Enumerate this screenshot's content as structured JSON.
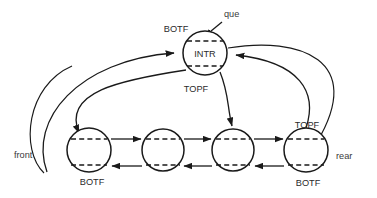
{
  "diagram": {
    "colors": {
      "stroke": "#1a1a1a",
      "text": "#2b2b2b",
      "background": "#ffffff"
    },
    "nodes": {
      "interior": {
        "id": "INTR",
        "inner_label": "INTR",
        "top_label": "BOTF",
        "bottom_label": "TOPF",
        "cx": 205,
        "cy": 53,
        "r": 22
      },
      "queue_items": [
        {
          "id": "node-1",
          "inner_label": "",
          "top_label": "",
          "bottom_label": "BOTF",
          "cx": 89,
          "cy": 150,
          "r": 22
        },
        {
          "id": "node-2",
          "inner_label": "",
          "top_label": "",
          "bottom_label": "",
          "cx": 163,
          "cy": 150,
          "r": 21
        },
        {
          "id": "node-3",
          "inner_label": "",
          "top_label": "",
          "bottom_label": "",
          "cx": 233,
          "cy": 150,
          "r": 21
        },
        {
          "id": "node-4",
          "inner_label": "",
          "top_label": "TOPF",
          "bottom_label": "BOTF",
          "cx": 306,
          "cy": 150,
          "r": 22
        }
      ]
    },
    "pointers": [
      {
        "name": "que",
        "label": "que",
        "x": 224,
        "y": 17
      },
      {
        "name": "front",
        "label": "front",
        "x": 16,
        "y": 155
      },
      {
        "name": "rear",
        "label": "rear",
        "x": 338,
        "y": 156
      }
    ],
    "field_labels": {
      "botf": "BOTF",
      "topf": "TOPF",
      "intr": "INTR"
    },
    "edges": [
      {
        "name": "que-to-intr",
        "kind": "arrow-straight"
      },
      {
        "name": "node1-to-node2",
        "kind": "arrow-straight"
      },
      {
        "name": "node2-to-node3",
        "kind": "arrow-straight"
      },
      {
        "name": "node3-to-node4",
        "kind": "arrow-straight"
      },
      {
        "name": "node4-to-node3",
        "kind": "arrow-straight"
      },
      {
        "name": "node3-to-node2",
        "kind": "arrow-straight"
      },
      {
        "name": "node2-to-node1",
        "kind": "arrow-straight"
      },
      {
        "name": "intr-to-node1",
        "kind": "arrow-curve"
      },
      {
        "name": "intr-to-node3",
        "kind": "arrow-curve"
      },
      {
        "name": "node1-to-intr",
        "kind": "arrow-curve"
      },
      {
        "name": "node4-to-intr",
        "kind": "arrow-curve"
      },
      {
        "name": "front-to-node1",
        "kind": "arrow-curve"
      },
      {
        "name": "rear-to-node4",
        "kind": "arrow-curve"
      }
    ]
  }
}
